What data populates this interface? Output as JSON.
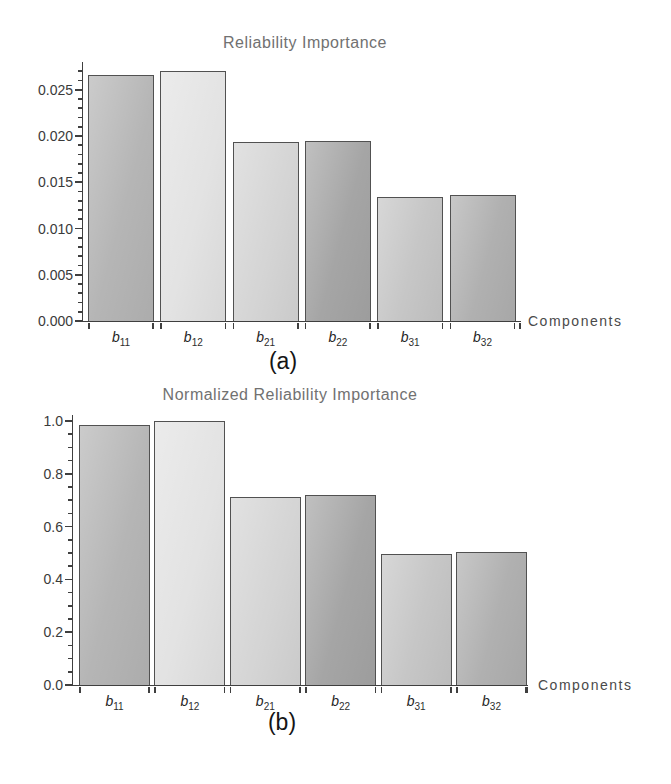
{
  "figure": {
    "captions": {
      "a": "(a)",
      "b": "(b)"
    }
  },
  "chart_data": [
    {
      "type": "bar",
      "title": "Reliability Importance",
      "xlabel": "Components",
      "ylabel": "",
      "caption": "(a)",
      "categories": [
        "b11",
        "b12",
        "b21",
        "b22",
        "b31",
        "b32"
      ],
      "category_syms": [
        {
          "sym": "b",
          "sub": "11"
        },
        {
          "sym": "b",
          "sub": "12"
        },
        {
          "sym": "b",
          "sub": "21"
        },
        {
          "sym": "b",
          "sub": "22"
        },
        {
          "sym": "b",
          "sub": "31"
        },
        {
          "sym": "b",
          "sub": "32"
        }
      ],
      "values": [
        0.0266,
        0.027,
        0.0193,
        0.0195,
        0.0134,
        0.0136
      ],
      "bar_colors": [
        "#b5b5b5",
        "#e3e3e3",
        "#d5d5d5",
        "#a5a5a5",
        "#c6c6c6",
        "#b0b0b0"
      ],
      "ylim": [
        0,
        0.028
      ],
      "y_ticks": {
        "values": [
          0.0,
          0.005,
          0.01,
          0.015,
          0.02,
          0.025
        ],
        "labels": [
          "0.000",
          "0.005",
          "0.010",
          "0.015",
          "0.020",
          "0.025"
        ],
        "minor_step": 0.001
      },
      "grid": false,
      "legend": false
    },
    {
      "type": "bar",
      "title": "Normalized Reliability Importance",
      "xlabel": "Components",
      "ylabel": "",
      "caption": "(b)",
      "categories": [
        "b11",
        "b12",
        "b21",
        "b22",
        "b31",
        "b32"
      ],
      "category_syms": [
        {
          "sym": "b",
          "sub": "11"
        },
        {
          "sym": "b",
          "sub": "12"
        },
        {
          "sym": "b",
          "sub": "21"
        },
        {
          "sym": "b",
          "sub": "22"
        },
        {
          "sym": "b",
          "sub": "31"
        },
        {
          "sym": "b",
          "sub": "32"
        }
      ],
      "values": [
        0.985,
        1.0,
        0.713,
        0.72,
        0.497,
        0.504
      ],
      "bar_colors": [
        "#b5b5b5",
        "#e3e3e3",
        "#d5d5d5",
        "#a5a5a5",
        "#c6c6c6",
        "#b0b0b0"
      ],
      "ylim": [
        0,
        1.023
      ],
      "y_ticks": {
        "values": [
          0.0,
          0.2,
          0.4,
          0.6,
          0.8,
          1.0
        ],
        "labels": [
          "0.0",
          "0.2",
          "0.4",
          "0.6",
          "0.8",
          "1.0"
        ],
        "minor_step": 0.05
      },
      "grid": false,
      "legend": false
    }
  ]
}
